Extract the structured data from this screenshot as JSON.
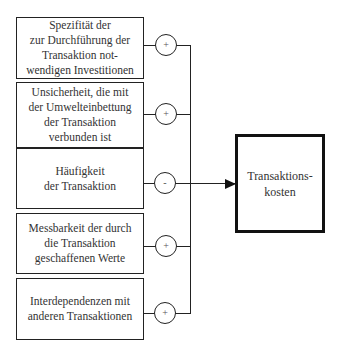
{
  "diagram": {
    "factors": [
      {
        "label": "Spezifität der\nzur Durchführung der\nTransaktion not-\nwendigen Investitionen",
        "sign": "+"
      },
      {
        "label": "Unsicherheit, die mit\nder Umwelteinbettung\nder Transaktion\nverbunden ist",
        "sign": "+"
      },
      {
        "label": "Häufigkeit\nder Transaktion",
        "sign": "-"
      },
      {
        "label": "Messbarkeit der durch\ndie Transaktion\ngeschaffenen Werte",
        "sign": "+"
      },
      {
        "label": "Interdependenzen mit\nanderen Transaktionen",
        "sign": "+"
      }
    ],
    "target": {
      "label": "Transaktions-\nkosten"
    }
  }
}
